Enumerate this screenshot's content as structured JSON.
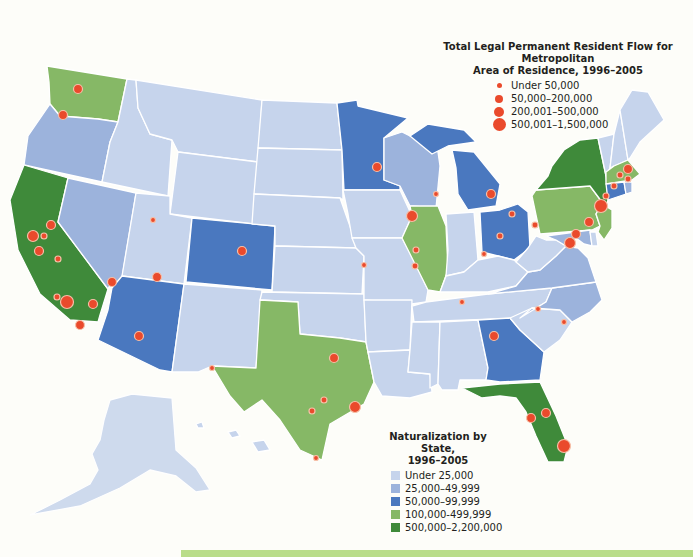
{
  "flow_legend": {
    "title_line1": "Total Legal Permanent Resident Flow for Metropolitan",
    "title_line2": "Area of Residence, 1996–2005",
    "items": [
      {
        "label": "Under 50,000",
        "size": 5
      },
      {
        "label": "50,000–200,000",
        "size": 8
      },
      {
        "label": "200,001–500,000",
        "size": 10
      },
      {
        "label": "500,001–1,500,000",
        "size": 13
      }
    ],
    "dot_color": "#ea4a2c"
  },
  "naturalization_legend": {
    "title_line1": "Naturalization by State,",
    "title_line2": "1996–2005",
    "items": [
      {
        "label": "Under 25,000",
        "color": "#c6d4ec"
      },
      {
        "label": "25,000–49,999",
        "color": "#9cb3dc"
      },
      {
        "label": "50,000–99,999",
        "color": "#4a78bf"
      },
      {
        "label": "100,000-499,999",
        "color": "#86b866"
      },
      {
        "label": "500,000–2,200,000",
        "color": "#3f8a3a"
      }
    ]
  },
  "state_categories": {
    "Under 25,000": [
      "MT",
      "ID",
      "WY",
      "ND",
      "SD",
      "NE",
      "KS",
      "OK",
      "NM",
      "UT",
      "IA",
      "MO",
      "AR",
      "LA",
      "MS",
      "AL",
      "TN",
      "KY",
      "IN",
      "WV",
      "SC",
      "VT",
      "NH",
      "ME",
      "DE",
      "AK",
      "HI"
    ],
    "25,000–49,999": [
      "OR",
      "NV",
      "WI",
      "NC",
      "VA",
      "MD",
      "RI"
    ],
    "50,000–99,999": [
      "CO",
      "AZ",
      "MN",
      "MI",
      "OH",
      "GA",
      "CT"
    ],
    "100,000-499,999": [
      "WA",
      "TX",
      "IL",
      "PA",
      "NJ",
      "MA"
    ],
    "500,000–2,200,000": [
      "CA",
      "NY",
      "FL"
    ]
  }
}
